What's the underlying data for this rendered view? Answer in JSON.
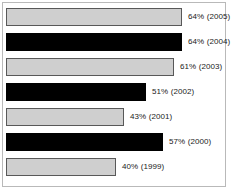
{
  "chart_data": {
    "type": "bar",
    "orientation": "horizontal",
    "title": "",
    "xlabel": "",
    "ylabel": "",
    "xlim": [
      0,
      70
    ],
    "grid": false,
    "legend": null,
    "categories": [
      "2005",
      "2004",
      "2003",
      "2002",
      "2001",
      "2000",
      "1999"
    ],
    "values": [
      64,
      64,
      61,
      51,
      43,
      57,
      40
    ],
    "bars": [
      {
        "label": "64% (2005)",
        "value": 64,
        "year": "2005",
        "style": "light"
      },
      {
        "label": "64% (2004)",
        "value": 64,
        "year": "2004",
        "style": "dark"
      },
      {
        "label": "61% (2003)",
        "value": 61,
        "year": "2003",
        "style": "light"
      },
      {
        "label": "51% (2002)",
        "value": 51,
        "year": "2002",
        "style": "dark"
      },
      {
        "label": "43% (2001)",
        "value": 43,
        "year": "2001",
        "style": "light"
      },
      {
        "label": "57% (2000)",
        "value": 57,
        "year": "2000",
        "style": "dark"
      },
      {
        "label": "40% (1999)",
        "value": 40,
        "year": "1999",
        "style": "light"
      }
    ],
    "colors": {
      "light_fill": "#cfcfcf",
      "light_border": "#585858",
      "dark_fill": "#000000",
      "frame_border": "#b9b9b9",
      "background": "#ffffff",
      "label_text": "#1a1a1a"
    }
  },
  "layout": {
    "bar_origin_x": 6,
    "first_bar_y": 8,
    "bar_height": 18,
    "row_pitch": 25,
    "px_per_percent": 2.75
  }
}
